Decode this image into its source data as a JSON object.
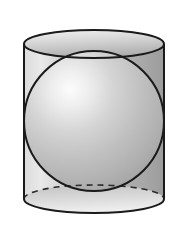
{
  "figure": {
    "title": "Sphere inscribed in a cylinder",
    "background_color": "#ffffff",
    "canvas": {
      "width": 185,
      "height": 234
    }
  },
  "geometry": {
    "cylinder": {
      "center_x": 94,
      "radius_x": 70,
      "top_ellipse_center_y": 44,
      "bottom_ellipse_center_y": 199,
      "ellipse_radius_y": 14,
      "body_top_y": 44,
      "body_bottom_y": 199,
      "left_wall_x": 24,
      "right_wall_x": 164
    },
    "sphere": {
      "center_x": 94,
      "center_y": 121,
      "radius": 70,
      "highlight_x": 62,
      "highlight_y": 92,
      "highlight_radius": 10
    }
  },
  "style": {
    "outline_color": "#1a1a1a",
    "outline_width": 2,
    "dashed_outline_color": "#2b2b2b",
    "dash_pattern": "6 5",
    "cylinder_light_gray": "#e8e8e8",
    "cylinder_mid_gray": "#b6b6b6",
    "cylinder_dark_gray": "#9a9a9a",
    "cylinder_lid_light": "#f0f0f0",
    "cylinder_lid_dark": "#b0b0b0",
    "sphere_highlight": "#fbfbfb",
    "sphere_mid": "#c6c6c6",
    "sphere_shadow": "#a6a6a6",
    "sphere_edge": "#9c9c9c"
  },
  "labels": {
    "shapes": [
      "cylinder",
      "sphere"
    ],
    "visible_text": []
  }
}
